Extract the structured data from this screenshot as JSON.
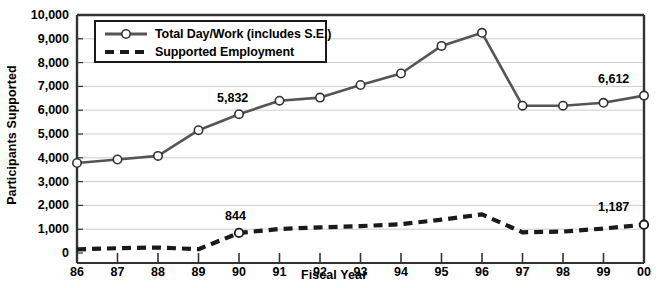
{
  "chart_data": {
    "type": "line",
    "title": "",
    "xlabel": "Fiscal Year",
    "ylabel": "Participants Supported",
    "categories": [
      "86",
      "87",
      "88",
      "89",
      "90",
      "91",
      "92",
      "93",
      "94",
      "95",
      "96",
      "97",
      "98",
      "99",
      "00"
    ],
    "ylim": [
      0,
      10000
    ],
    "ytick_labels": [
      "0",
      "1,000",
      "2,000",
      "3,000",
      "4,000",
      "5,000",
      "6,000",
      "7,000",
      "8,000",
      "9,000",
      "10,000"
    ],
    "ytick_values": [
      0,
      1000,
      2000,
      3000,
      4000,
      5000,
      6000,
      7000,
      8000,
      9000,
      10000
    ],
    "grid": true,
    "legend_position": "top-left",
    "series": [
      {
        "name": "Total Day/Work (includes S.E.)",
        "marker": "circle",
        "style": "solid",
        "color": "#555555",
        "values": [
          3780,
          3930,
          4080,
          5160,
          5832,
          6400,
          6530,
          7060,
          7540,
          8700,
          9250,
          6190,
          6190,
          6310,
          6612
        ]
      },
      {
        "name": "Supported Employment",
        "marker": "none",
        "style": "dashed",
        "color": "#1a1a1a",
        "values": [
          150,
          200,
          230,
          160,
          844,
          1010,
          1080,
          1130,
          1210,
          1400,
          1620,
          870,
          900,
          1030,
          1187
        ]
      }
    ],
    "annotations": [
      {
        "label": "5,832",
        "series": 0,
        "category": "90",
        "value": 5832
      },
      {
        "label": "6,612",
        "series": 0,
        "category": "00",
        "value": 6612
      },
      {
        "label": "844",
        "series": 1,
        "category": "90",
        "value": 844
      },
      {
        "label": "1,187",
        "series": 1,
        "category": "00",
        "value": 1187
      }
    ]
  },
  "legend": {
    "items": [
      {
        "label": "Total Day/Work (includes S.E.)"
      },
      {
        "label": "Supported Employment"
      }
    ]
  },
  "colors": {
    "series_total": "#555555",
    "series_se": "#1a1a1a",
    "axis": "#333333",
    "grid": "#cccccc",
    "background": "#ffffff"
  }
}
